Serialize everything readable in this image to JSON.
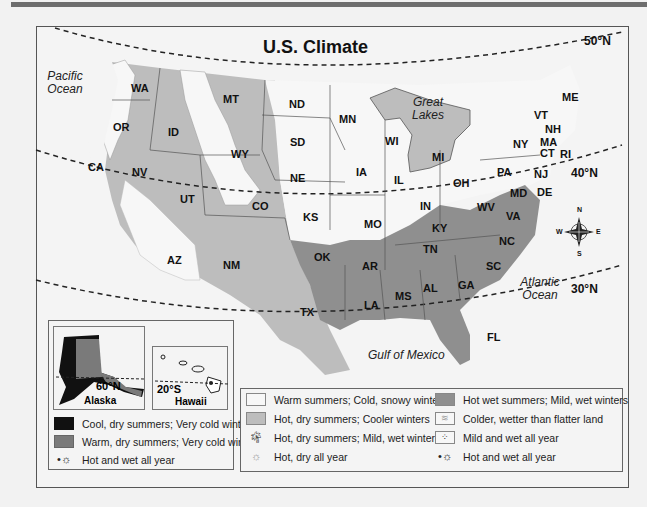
{
  "title": "U.S. Climate",
  "latitudes": [
    "50°N",
    "40°N",
    "30°N"
  ],
  "water_labels": {
    "pacific": "Pacific Ocean",
    "atlantic": "Atlantic Ocean",
    "gulf": "Gulf of Mexico",
    "great_lakes": "Great Lakes"
  },
  "states": [
    "WA",
    "OR",
    "CA",
    "ID",
    "NV",
    "MT",
    "WY",
    "UT",
    "AZ",
    "CO",
    "NM",
    "ND",
    "SD",
    "NE",
    "KS",
    "OK",
    "TX",
    "MN",
    "IA",
    "MO",
    "AR",
    "LA",
    "WI",
    "IL",
    "MI",
    "IN",
    "OH",
    "KY",
    "TN",
    "MS",
    "AL",
    "GA",
    "FL",
    "SC",
    "NC",
    "VA",
    "WV",
    "PA",
    "NY",
    "MD",
    "DE",
    "NJ",
    "VT",
    "NH",
    "MA",
    "CT",
    "RI",
    "ME"
  ],
  "compass": {
    "n": "N",
    "s": "S",
    "e": "E",
    "w": "W"
  },
  "insets": {
    "alaska": {
      "label": "Alaska",
      "latitude": "60°N"
    },
    "hawaii": {
      "label": "Hawaii",
      "latitude": "20°S"
    }
  },
  "legend_left": [
    {
      "label": "Cool, dry summers; Very cold winters",
      "color": "#111111"
    },
    {
      "label": "Warm, dry summers; Very cold winters",
      "color": "#7a7a7a"
    },
    {
      "label": "Hot and wet all year",
      "icon": "sun-dots-icon"
    }
  ],
  "legend_mid": [
    {
      "label": "Warm summers; Cold, snowy winters",
      "color": "#f7f7f7"
    },
    {
      "label": "Hot, dry summers; Cooler winters",
      "color": "#bdbdbd"
    },
    {
      "label": "Hot, dry summers; Mild, wet winters",
      "icon": "palm-tree-icon"
    },
    {
      "label": "Hot, dry all year",
      "icon": "sun-icon"
    }
  ],
  "legend_right": [
    {
      "label": "Hot wet summers; Mild, wet winters",
      "color": "#8f8f8f"
    },
    {
      "label": "Colder, wetter than flatter land",
      "icon": "wave-pattern-icon"
    },
    {
      "label": "Mild and wet all year",
      "icon": "dots-pattern-icon"
    },
    {
      "label": "Hot and wet all year",
      "icon": "sun-dots-icon"
    }
  ],
  "colors": {
    "background": "#f2f2f2",
    "warm_cold": "#f7f7f7",
    "hot_dry_cool": "#bdbdbd",
    "hot_wet": "#8f8f8f",
    "border": "#555555"
  }
}
